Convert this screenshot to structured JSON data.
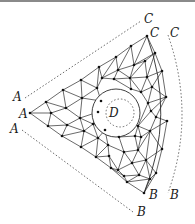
{
  "diagram": {
    "type": "triangulated-mesh",
    "labels": {
      "a_outer_top": "A",
      "a_apex": "A",
      "a_outer_bottom": "A",
      "c_outer_top": "C",
      "c_corner": "C",
      "c_outer_right": "C",
      "b_corner": "B",
      "b_outer_right": "B",
      "b_outer_bottom": "B",
      "d_center": "D"
    },
    "colors": {
      "line": "#2a2a2a",
      "node": "#111111",
      "dashed": "#444444",
      "label": "#1a1a1a",
      "border": "#8a8a8a"
    },
    "apex_A": [
      30,
      113
    ],
    "corner_C": [
      147,
      36
    ],
    "corner_B": [
      144,
      193
    ],
    "hole": {
      "cx": 116,
      "cy": 113,
      "r": 24
    },
    "inner_dotted_circle": {
      "cx": 120,
      "cy": 113,
      "r": 14
    },
    "nodes": [
      [
        30,
        113
      ],
      [
        147,
        36
      ],
      [
        144,
        193
      ],
      [
        46,
        102
      ],
      [
        63,
        90
      ],
      [
        81,
        80
      ],
      [
        99,
        67
      ],
      [
        116,
        57
      ],
      [
        131,
        46
      ],
      [
        48,
        126
      ],
      [
        62,
        136
      ],
      [
        81,
        147
      ],
      [
        96,
        157
      ],
      [
        111,
        168
      ],
      [
        127,
        182
      ],
      [
        155,
        53
      ],
      [
        162,
        71
      ],
      [
        166,
        97
      ],
      [
        167,
        121
      ],
      [
        162,
        149
      ],
      [
        156,
        173
      ],
      [
        51,
        113
      ],
      [
        66,
        108
      ],
      [
        80,
        118
      ],
      [
        67,
        125
      ],
      [
        84,
        131
      ],
      [
        98,
        138
      ],
      [
        82,
        98
      ],
      [
        97,
        88
      ],
      [
        102,
        78
      ],
      [
        118,
        70
      ],
      [
        134,
        65
      ],
      [
        145,
        61
      ],
      [
        114,
        79
      ],
      [
        130,
        78
      ],
      [
        147,
        77
      ],
      [
        152,
        87
      ],
      [
        141,
        92
      ],
      [
        131,
        89
      ],
      [
        148,
        103
      ],
      [
        156,
        117
      ],
      [
        150,
        131
      ],
      [
        141,
        137
      ],
      [
        138,
        126
      ],
      [
        151,
        111
      ],
      [
        98,
        112
      ],
      [
        93,
        124
      ],
      [
        101,
        101
      ],
      [
        105,
        130
      ],
      [
        119,
        137
      ],
      [
        135,
        136
      ],
      [
        108,
        145
      ],
      [
        124,
        152
      ],
      [
        138,
        150
      ],
      [
        146,
        160
      ],
      [
        132,
        163
      ],
      [
        118,
        170
      ],
      [
        139,
        175
      ],
      [
        150,
        179
      ],
      [
        124,
        176
      ],
      [
        109,
        156
      ]
    ],
    "edges": [
      [
        0,
        3
      ],
      [
        3,
        4
      ],
      [
        4,
        5
      ],
      [
        5,
        6
      ],
      [
        6,
        7
      ],
      [
        7,
        8
      ],
      [
        8,
        1
      ],
      [
        0,
        9
      ],
      [
        9,
        10
      ],
      [
        10,
        11
      ],
      [
        11,
        12
      ],
      [
        12,
        13
      ],
      [
        13,
        14
      ],
      [
        14,
        2
      ],
      [
        0,
        21
      ],
      [
        3,
        21
      ],
      [
        9,
        21
      ],
      [
        21,
        22
      ],
      [
        3,
        22
      ],
      [
        4,
        22
      ],
      [
        22,
        23
      ],
      [
        21,
        24
      ],
      [
        9,
        24
      ],
      [
        24,
        23
      ],
      [
        24,
        10
      ],
      [
        10,
        25
      ],
      [
        24,
        25
      ],
      [
        25,
        23
      ],
      [
        25,
        26
      ],
      [
        11,
        25
      ],
      [
        11,
        26
      ],
      [
        26,
        12
      ],
      [
        4,
        27
      ],
      [
        22,
        27
      ],
      [
        27,
        5
      ],
      [
        27,
        23
      ],
      [
        27,
        28
      ],
      [
        5,
        28
      ],
      [
        28,
        6
      ],
      [
        28,
        29
      ],
      [
        6,
        29
      ],
      [
        29,
        7
      ],
      [
        29,
        30
      ],
      [
        7,
        30
      ],
      [
        30,
        8
      ],
      [
        30,
        31
      ],
      [
        8,
        31
      ],
      [
        31,
        1
      ],
      [
        31,
        15
      ],
      [
        1,
        15
      ],
      [
        31,
        32
      ],
      [
        15,
        32
      ],
      [
        29,
        33
      ],
      [
        30,
        33
      ],
      [
        33,
        34
      ],
      [
        30,
        34
      ],
      [
        34,
        31
      ],
      [
        34,
        32
      ],
      [
        32,
        35
      ],
      [
        34,
        35
      ],
      [
        15,
        35
      ],
      [
        35,
        16
      ],
      [
        15,
        16
      ],
      [
        35,
        36
      ],
      [
        16,
        36
      ],
      [
        36,
        37
      ],
      [
        35,
        37
      ],
      [
        34,
        37
      ],
      [
        37,
        38
      ],
      [
        34,
        38
      ],
      [
        33,
        38
      ],
      [
        36,
        17
      ],
      [
        16,
        17
      ],
      [
        36,
        39
      ],
      [
        37,
        39
      ],
      [
        39,
        17
      ],
      [
        39,
        44
      ],
      [
        17,
        44
      ],
      [
        44,
        40
      ],
      [
        17,
        40
      ],
      [
        40,
        18
      ],
      [
        40,
        41
      ],
      [
        18,
        41
      ],
      [
        41,
        19
      ],
      [
        18,
        19
      ],
      [
        41,
        42
      ],
      [
        42,
        43
      ],
      [
        43,
        44
      ],
      [
        39,
        43
      ],
      [
        43,
        41
      ],
      [
        27,
        47
      ],
      [
        28,
        47
      ],
      [
        47,
        45
      ],
      [
        23,
        45
      ],
      [
        45,
        46
      ],
      [
        23,
        46
      ],
      [
        46,
        25
      ],
      [
        46,
        26
      ],
      [
        26,
        48
      ],
      [
        46,
        48
      ],
      [
        48,
        49
      ],
      [
        49,
        50
      ],
      [
        50,
        42
      ],
      [
        43,
        50
      ],
      [
        48,
        51
      ],
      [
        26,
        51
      ],
      [
        12,
        51
      ],
      [
        51,
        52
      ],
      [
        49,
        52
      ],
      [
        52,
        53
      ],
      [
        50,
        53
      ],
      [
        53,
        42
      ],
      [
        53,
        41
      ],
      [
        53,
        54
      ],
      [
        41,
        54
      ],
      [
        54,
        19
      ],
      [
        19,
        20
      ],
      [
        54,
        20
      ],
      [
        54,
        55
      ],
      [
        53,
        55
      ],
      [
        52,
        55
      ],
      [
        55,
        56
      ],
      [
        52,
        56
      ],
      [
        51,
        60
      ],
      [
        60,
        56
      ],
      [
        12,
        60
      ],
      [
        60,
        13
      ],
      [
        56,
        13
      ],
      [
        56,
        59
      ],
      [
        13,
        59
      ],
      [
        59,
        14
      ],
      [
        55,
        57
      ],
      [
        57,
        59
      ],
      [
        57,
        54
      ],
      [
        57,
        58
      ],
      [
        54,
        58
      ],
      [
        58,
        20
      ],
      [
        20,
        2
      ],
      [
        58,
        2
      ],
      [
        57,
        14
      ],
      [
        14,
        58
      ]
    ],
    "outer_arcs": {
      "top": {
        "from_label": "A",
        "to_label": "C"
      },
      "right": {
        "from_label": "C",
        "to_label": "B"
      },
      "bottom": {
        "from_label": "A",
        "to_label": "B"
      }
    }
  }
}
